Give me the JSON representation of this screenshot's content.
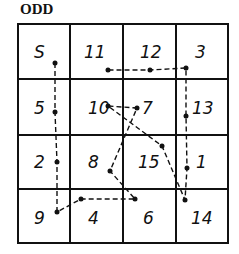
{
  "title": "ODD",
  "grid": {
    "rows": [
      [
        "S",
        "11",
        "12",
        "3"
      ],
      [
        "5",
        "10",
        "7",
        "13"
      ],
      [
        "2",
        "8",
        "15",
        "1"
      ],
      [
        "9",
        "4",
        "6",
        "14"
      ]
    ]
  },
  "path_order": [
    "S",
    "5",
    "2",
    "9",
    "4",
    "6",
    "8",
    "7",
    "10",
    "15",
    "14",
    "1",
    "13",
    "3",
    "12",
    "11"
  ],
  "colors": {
    "ink": "#111111",
    "background": "#ffffff"
  }
}
